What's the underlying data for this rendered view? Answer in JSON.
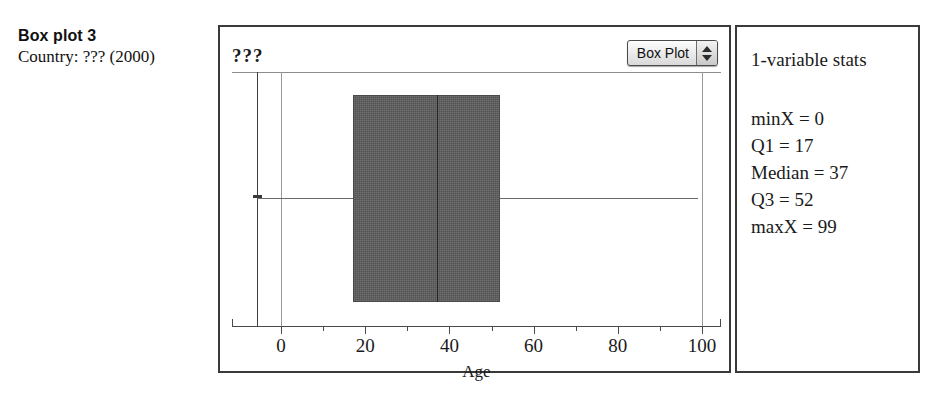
{
  "caption": {
    "title": "Box plot 3",
    "subtitle": "Country: ??? (2000)"
  },
  "chart_panel": {
    "plot_title": "???",
    "plot_type_menu": {
      "selected": "Box Plot",
      "stepper_icon": "up-down-arrows-icon"
    },
    "x_axis_title": "Age"
  },
  "stats_panel": {
    "title": "1-variable stats",
    "rows": [
      "minX = 0",
      "Q1 = 17",
      "Median = 37",
      "Q3 = 52",
      "maxX = 99"
    ]
  },
  "chart_data": {
    "type": "box",
    "title": "???",
    "xlabel": "Age",
    "ylabel": "",
    "xlim": [
      -6,
      105
    ],
    "grid": false,
    "legend": null,
    "categories": [
      "Age"
    ],
    "boxes": [
      {
        "name": "Age",
        "min": 0,
        "q1": 17,
        "median": 37,
        "q3": 52,
        "max": 99
      }
    ],
    "x_ticks_major": [
      0,
      20,
      40,
      60,
      80,
      100
    ],
    "x_ticks_major_labels": [
      "0",
      "20",
      "40",
      "60",
      "80",
      "100"
    ],
    "x_ticks_minor": [
      10,
      30,
      50,
      70,
      90
    ],
    "colors": {
      "box_fill": "#5c5c5c",
      "box_border": "#4a4a4a",
      "median": "#262626",
      "whisker": "#6b6b6b",
      "frame": "#3a3a3a"
    }
  }
}
